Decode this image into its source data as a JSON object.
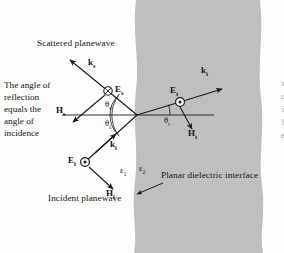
{
  "figure": {
    "title_text": "Planar dielectric interface reflection and transmission diagram",
    "background_color": "#fdfdfc",
    "medium_fill_color": "#bfbfbf",
    "line_color": "#1a1a1a"
  },
  "annotations": {
    "scattered_planewave": "Scattered planewave",
    "incident_planewave": "Incident planewave",
    "planar_interface": "Planar dielectric interface",
    "side_note_line1": "The angle of",
    "side_note_line2": "reflection",
    "side_note_line3": "equals the",
    "side_note_line4": "angle of",
    "side_note_line5": "incidence",
    "side_note_full": "The angle of reflection equals the angle of incidence"
  },
  "vectors": {
    "k_s": {
      "base": "k",
      "sub": "s",
      "name": "scattered-wavevector"
    },
    "E_s": {
      "base": "E",
      "sub": "s",
      "name": "scattered-electric-field",
      "marker": "circle-x"
    },
    "H_s": {
      "base": "H",
      "sub": "s",
      "name": "scattered-magnetic-field"
    },
    "k_i": {
      "base": "k",
      "sub": "i",
      "name": "incident-wavevector"
    },
    "E_i": {
      "base": "E",
      "sub": "i",
      "name": "incident-electric-field",
      "marker": "circle-dot"
    },
    "H_i": {
      "base": "H",
      "sub": "i",
      "name": "incident-magnetic-field"
    },
    "k_t": {
      "base": "k",
      "sub": "t",
      "name": "transmitted-wavevector"
    },
    "E_t": {
      "base": "E",
      "sub": "t",
      "name": "transmitted-electric-field",
      "marker": "circle-dot"
    },
    "H_t": {
      "base": "H",
      "sub": "t",
      "name": "transmitted-magnetic-field"
    }
  },
  "angles": {
    "theta_s": {
      "base": "θ",
      "sub": "s",
      "name": "scattering-angle"
    },
    "theta_i": {
      "base": "θ",
      "sub": "i",
      "name": "incidence-angle"
    },
    "theta_t": {
      "base": "θ",
      "sub": "t",
      "name": "transmission-angle"
    }
  },
  "permittivities": {
    "eps_1": {
      "base": "ε",
      "sub": "1",
      "name": "permittivity-medium-1"
    },
    "eps_2": {
      "base": "ε",
      "sub": "2",
      "name": "permittivity-medium-2"
    }
  },
  "edge_fragments": {
    "frag1": "t",
    "frag2": "c",
    "frag3": "i",
    "frag4": "l",
    "frag5": "e"
  }
}
